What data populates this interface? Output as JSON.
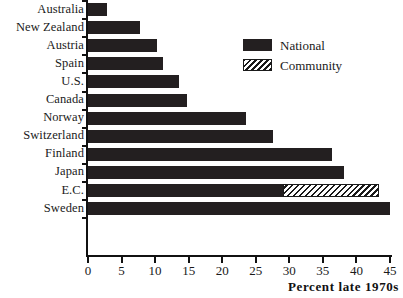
{
  "chart_data": {
    "type": "bar",
    "orientation": "horizontal",
    "stacked": true,
    "title": "",
    "xlabel": "Percent late 1970s",
    "ylabel": "",
    "xlim": [
      0,
      45
    ],
    "xticks": [
      0,
      5,
      10,
      15,
      20,
      25,
      30,
      35,
      40,
      45
    ],
    "xtick_labels": [
      "0",
      "5",
      "10",
      "15",
      "20",
      "25",
      "30",
      "35",
      "40",
      "45"
    ],
    "grid": false,
    "legend_position": "top-right",
    "categories": [
      "Australia",
      "New Zealand",
      "Austria",
      "Spain",
      "U.S.",
      "Canada",
      "Norway",
      "Switzerland",
      "Finland",
      "Japan",
      "E.C.",
      "Sweden"
    ],
    "series": [
      {
        "name": "National",
        "color": "#231f20",
        "pattern": "solid",
        "values": [
          2.9,
          7.7,
          10.3,
          11.2,
          13.5,
          14.7,
          23.5,
          27.5,
          36.3,
          38.2,
          29.0,
          45.0
        ]
      },
      {
        "name": "Community",
        "color": "#ffffff",
        "pattern": "diagonal-hatch",
        "values": [
          0,
          0,
          0,
          0,
          0,
          0,
          0,
          0,
          0,
          0,
          14.3,
          0
        ]
      }
    ],
    "totals": [
      2.9,
      7.7,
      10.3,
      11.2,
      13.5,
      14.7,
      23.5,
      27.5,
      36.3,
      38.2,
      43.3,
      45.0
    ]
  },
  "legend": {
    "items": [
      {
        "label": "National",
        "swatch": "solid-dark-swatch"
      },
      {
        "label": "Community",
        "swatch": "hatched-swatch"
      }
    ]
  },
  "axis": {
    "x_title": "Percent late 1970s"
  }
}
